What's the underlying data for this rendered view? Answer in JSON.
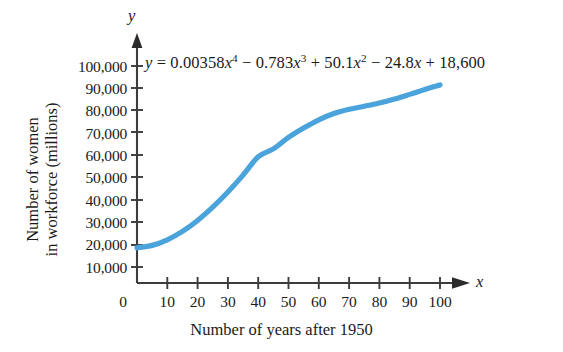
{
  "chart_data": {
    "type": "line",
    "title": "",
    "equation_display": "y = 0.00358x^4 - 0.783x^3 + 50.1x^2 - 24.8x + 18,600",
    "equation_parts": {
      "lhs": "y",
      "equals": "=",
      "t1_coef": "0.00358",
      "t1_var": "x",
      "t1_exp": "4",
      "op1": "−",
      "t2_coef": "0.783",
      "t2_var": "x",
      "t2_exp": "3",
      "op2": "+",
      "t3_coef": "50.1",
      "t3_var": "x",
      "t3_exp": "2",
      "op3": "−",
      "t4_coef": "24.8",
      "t4_var": "x",
      "op4": "+",
      "t5_const": "18,600"
    },
    "xlabel": "Number of years after 1950",
    "ylabel_line1": "Number of women",
    "ylabel_line2": "in workforce (millions)",
    "x_axis_name": "x",
    "y_axis_name": "y",
    "xlim": [
      0,
      105
    ],
    "ylim": [
      0,
      104000
    ],
    "grid": false,
    "legend": "none",
    "xticks": [
      0,
      10,
      20,
      30,
      40,
      50,
      60,
      70,
      80,
      90,
      100
    ],
    "xtick_labels": [
      "0",
      "10",
      "20",
      "30",
      "40",
      "50",
      "60",
      "70",
      "80",
      "90",
      "100"
    ],
    "yticks": [
      10000,
      20000,
      30000,
      40000,
      50000,
      60000,
      70000,
      80000,
      90000,
      100000
    ],
    "ytick_labels": [
      "10,000",
      "20,000",
      "30,000",
      "40,000",
      "50,000",
      "60,000",
      "70,000",
      "80,000",
      "90,000",
      "100,000"
    ],
    "curve_color": "#4BA3DC",
    "curve_width_px": 5.2,
    "series": [
      {
        "name": "women in workforce (quartic model)",
        "x": [
          0,
          5,
          10,
          15,
          20,
          25,
          30,
          35,
          40,
          45,
          50,
          55,
          60,
          65,
          70,
          75,
          80,
          85,
          90,
          95,
          100
        ],
        "y": [
          18600,
          19680,
          22180,
          25950,
          30860,
          36780,
          43580,
          51140,
          59330,
          62900,
          68000,
          72200,
          75900,
          78700,
          80600,
          82000,
          83400,
          85200,
          87300,
          89500,
          91500
        ]
      }
    ]
  },
  "axis_labels": {
    "x_name": "x",
    "y_name": "y"
  },
  "icons": {
    "x_arrow": "arrow-right-icon",
    "y_arrow": "arrow-up-icon"
  }
}
